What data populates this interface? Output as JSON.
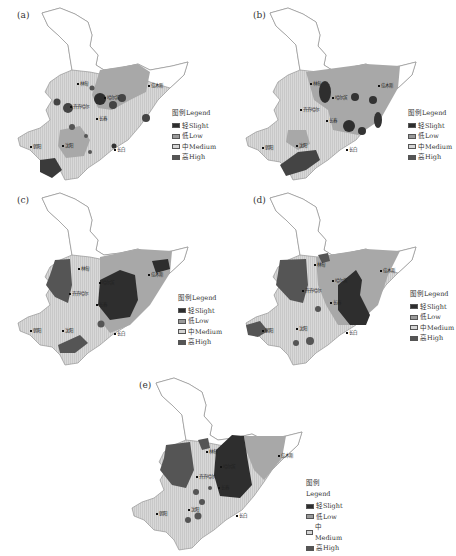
{
  "figure": {
    "panels": [
      {
        "id": "a",
        "label": "(a)"
      },
      {
        "id": "b",
        "label": "(b)"
      },
      {
        "id": "c",
        "label": "(c)"
      },
      {
        "id": "d",
        "label": "(d)"
      },
      {
        "id": "e",
        "label": "(e)"
      }
    ],
    "legend": {
      "title": "图例Legend",
      "items": [
        {
          "label": "轻Slight",
          "color": "#2e2e2e"
        },
        {
          "label": "低Low",
          "color": "#9a9a9a"
        },
        {
          "label": "中Medium",
          "color": "#d4d4d4"
        },
        {
          "label": "高High",
          "color": "#555555"
        }
      ]
    },
    "cities": {
      "linDian": "林甸",
      "harbin": "哈尔滨",
      "jiamusi": "佳木斯",
      "qiqihar": "齐齐哈尔",
      "changchun": "长春",
      "shenyang": "沈阳",
      "chaoyang": "朝阳",
      "changbai": "长白"
    }
  }
}
